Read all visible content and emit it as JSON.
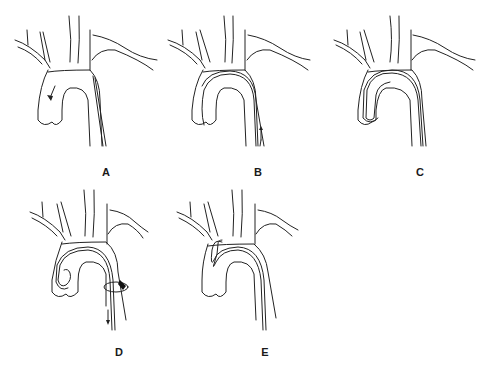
{
  "figure": {
    "stroke_color": "#222222",
    "background": "#ffffff",
    "panels": [
      {
        "id": "A",
        "label": "A",
        "arrow_direction": "down",
        "arrow_location": "ascending aorta"
      },
      {
        "id": "B",
        "label": "B",
        "arrow_direction": "up",
        "arrow_location": "descending aorta"
      },
      {
        "id": "C",
        "label": "C",
        "arrow_direction": "none",
        "arrow_location": ""
      },
      {
        "id": "D",
        "label": "D",
        "arrow_direction": "down",
        "arrow_location": "descending aorta",
        "marker": "ring-snare"
      },
      {
        "id": "E",
        "label": "E",
        "arrow_direction": "none",
        "arrow_location": ""
      }
    ]
  }
}
